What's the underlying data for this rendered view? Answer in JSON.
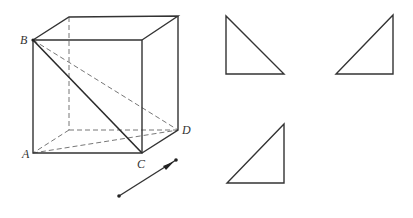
{
  "figure": {
    "cube": {
      "labels": {
        "A": "A",
        "B": "B",
        "C": "C",
        "D": "D"
      },
      "vertices": {
        "A": [
          33,
          153
        ],
        "B": [
          33,
          40
        ],
        "C": [
          142,
          153
        ],
        "D": [
          178,
          130
        ],
        "top_front_right": [
          142,
          40
        ],
        "top_back_left": [
          69,
          17
        ],
        "top_back_right": [
          178,
          16
        ],
        "bottom_back_left": [
          69,
          130
        ]
      }
    },
    "vector": {
      "from": [
        119,
        196
      ],
      "to": [
        176,
        160
      ]
    },
    "triangles": [
      {
        "name": "right-angle-bottom-left",
        "points": [
          [
            226,
            16
          ],
          [
            226,
            74
          ],
          [
            284,
            74
          ]
        ]
      },
      {
        "name": "right-angle-bottom-right-top",
        "points": [
          [
            393,
            15
          ],
          [
            393,
            74
          ],
          [
            336,
            74
          ]
        ]
      },
      {
        "name": "right-angle-bottom-right-lower",
        "points": [
          [
            284,
            124
          ],
          [
            284,
            183
          ],
          [
            227,
            183
          ]
        ]
      }
    ]
  }
}
